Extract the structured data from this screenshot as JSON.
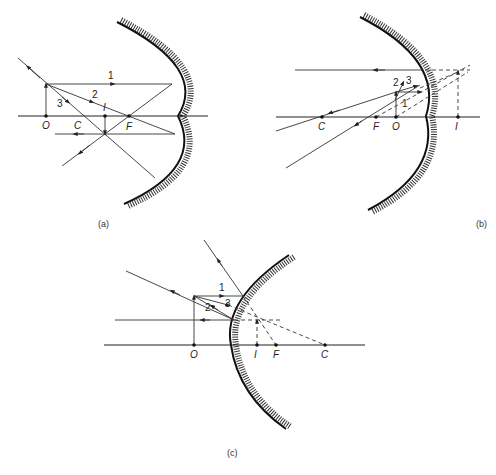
{
  "figure": {
    "panels": [
      {
        "id": "a",
        "caption": "(a)",
        "mirror_type": "concave",
        "points": {
          "O": "O",
          "C": "C",
          "I": "I",
          "F": "F"
        },
        "rays": {
          "r1": "1",
          "r2": "2",
          "r3": "3"
        }
      },
      {
        "id": "b",
        "caption": "(b)",
        "mirror_type": "concave",
        "points": {
          "C": "C",
          "F": "F",
          "O": "O",
          "I": "I"
        },
        "rays": {
          "r1": "1",
          "r2": "2",
          "r3": "3"
        }
      },
      {
        "id": "c",
        "caption": "(c)",
        "mirror_type": "convex",
        "points": {
          "O": "O",
          "I": "I",
          "F": "F",
          "C": "C"
        },
        "rays": {
          "r1": "1",
          "r2": "2",
          "r3": "3"
        }
      }
    ]
  }
}
